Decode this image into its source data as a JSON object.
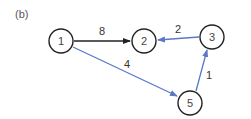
{
  "panel_label": "(b)",
  "colors": {
    "black_edge": "#222222",
    "blue_edge": "#5a78c8",
    "node_stroke": "#222222"
  },
  "nodes": [
    {
      "id": "1",
      "label": "1",
      "x": 61,
      "y": 41
    },
    {
      "id": "2",
      "label": "2",
      "x": 144,
      "y": 41
    },
    {
      "id": "3",
      "label": "3",
      "x": 212,
      "y": 37
    },
    {
      "id": "5",
      "label": "5",
      "x": 190,
      "y": 103
    }
  ],
  "edges": [
    {
      "from": "1",
      "to": "2",
      "weight": "8",
      "color": "black"
    },
    {
      "from": "3",
      "to": "2",
      "weight": "2",
      "color": "blue"
    },
    {
      "from": "1",
      "to": "5",
      "weight": "4",
      "color": "blue"
    },
    {
      "from": "5",
      "to": "3",
      "weight": "1",
      "color": "blue"
    }
  ]
}
